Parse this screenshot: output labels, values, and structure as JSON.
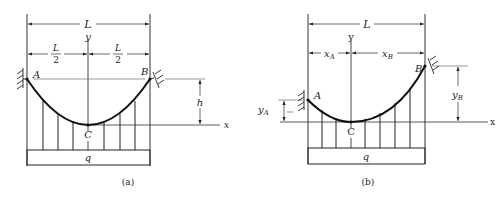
{
  "figure": {
    "panel_a": {
      "caption": "(a)",
      "span_label": "L",
      "half_left_num": "L",
      "half_left_den": "2",
      "half_right_num": "L",
      "half_right_den": "2",
      "axis_y": "y",
      "axis_x": "x",
      "support_left": "A",
      "support_right": "B",
      "low_point": "C",
      "sag_label": "h",
      "load_label": "q"
    },
    "panel_b": {
      "caption": "(b)",
      "span_label": "L",
      "xa_label": "x",
      "xa_sub": "A",
      "xb_label": "x",
      "xb_sub": "B",
      "axis_y": "y",
      "axis_x": "x",
      "support_left": "A",
      "support_right": "B",
      "low_point": "C",
      "ya_label": "y",
      "ya_sub": "A",
      "yb_label": "y",
      "yb_sub": "B",
      "load_label": "q"
    },
    "colors": {
      "ink": "#222222",
      "thin": "#444444",
      "background": "#ffffff"
    }
  }
}
